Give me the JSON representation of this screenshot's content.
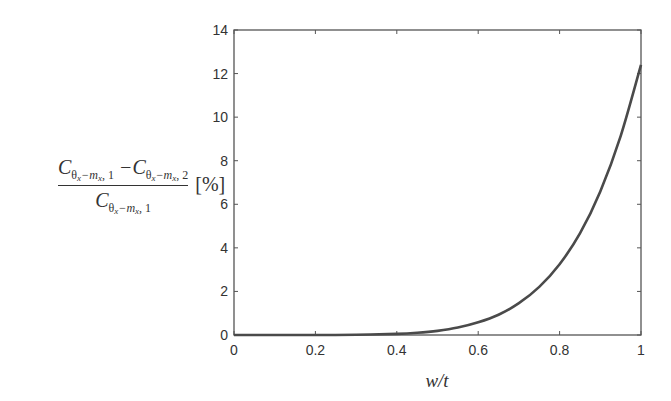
{
  "chart_data": {
    "type": "line",
    "title": "",
    "xlabel": "w/t",
    "ylabel": "(C_{θx−mx,1} − C_{θx−mx,2}) / C_{θx−mx,1} [%]",
    "xlim": [
      0,
      1
    ],
    "ylim": [
      0,
      14
    ],
    "xticks": [
      0,
      0.2,
      0.4,
      0.6,
      0.8,
      1
    ],
    "xtick_labels": [
      "0",
      "0.2",
      "0.4",
      "0.6",
      "0.8",
      "1"
    ],
    "yticks": [
      0,
      2,
      4,
      6,
      8,
      10,
      12,
      14
    ],
    "ytick_labels": [
      "0",
      "2",
      "4",
      "6",
      "8",
      "10",
      "12",
      "14"
    ],
    "grid": false,
    "legend": null,
    "series": [
      {
        "name": "relative difference",
        "color": "#4a4a4a",
        "x": [
          0,
          0.1,
          0.2,
          0.3,
          0.4,
          0.45,
          0.5,
          0.55,
          0.6,
          0.65,
          0.7,
          0.75,
          0.8,
          0.85,
          0.9,
          0.95,
          1.0
        ],
        "y": [
          0,
          0.0,
          0.001,
          0.01,
          0.05,
          0.1,
          0.19,
          0.34,
          0.58,
          0.93,
          1.46,
          2.21,
          3.25,
          4.66,
          6.59,
          9.13,
          12.4
        ]
      }
    ]
  },
  "labels": {
    "num_C1": "C",
    "num_C2": "C",
    "den_C": "C",
    "theta": "θ",
    "x_sub": "x",
    "m": "m",
    "minus": "−",
    "idx1": "1",
    "idx2": "2",
    "unit": "[%]",
    "xlabel": "w/t"
  },
  "colors": {
    "axis": "#555555",
    "curve": "#4a4a4a",
    "text": "#333333",
    "background": "#ffffff"
  }
}
